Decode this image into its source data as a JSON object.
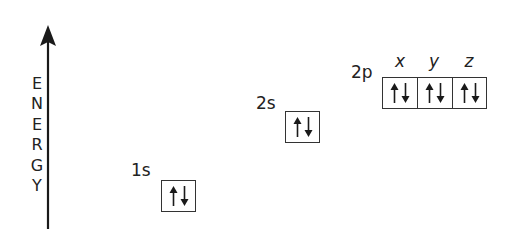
{
  "axis": {
    "label_letters": [
      "E",
      "N",
      "E",
      "R",
      "G",
      "Y"
    ],
    "label": "ENERGY",
    "direction": "up",
    "color": "#1a1a1a"
  },
  "orbitals": [
    {
      "name": "1s",
      "label": "1s",
      "cells": [
        {
          "sublabel": "",
          "electrons": [
            "up",
            "down"
          ]
        }
      ]
    },
    {
      "name": "2s",
      "label": "2s",
      "cells": [
        {
          "sublabel": "",
          "electrons": [
            "up",
            "down"
          ]
        }
      ]
    },
    {
      "name": "2p",
      "label": "2p",
      "cells": [
        {
          "sublabel": "x",
          "electrons": [
            "up",
            "down"
          ]
        },
        {
          "sublabel": "y",
          "electrons": [
            "up",
            "down"
          ]
        },
        {
          "sublabel": "z",
          "electrons": [
            "up",
            "down"
          ]
        }
      ]
    }
  ],
  "colors": {
    "line": "#1a1a1a",
    "text": "#222222",
    "background": "#ffffff"
  }
}
